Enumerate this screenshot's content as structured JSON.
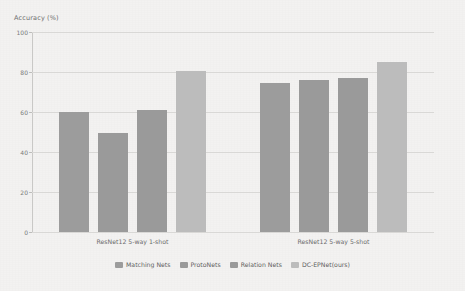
{
  "chart_data": {
    "type": "bar",
    "title": "",
    "xlabel": "",
    "ylabel": "Accuracy (%)",
    "ylim": [
      0,
      100
    ],
    "yticks": [
      0,
      20,
      40,
      60,
      80,
      100
    ],
    "ytick_labels": [
      "0",
      "20",
      "40",
      "60",
      "80",
      "100"
    ],
    "grid": true,
    "legend_position": "bottom",
    "categories": [
      "ResNet12 5-way 1-shot",
      "ResNet12 5-way 5-shot"
    ],
    "series": [
      {
        "name": "Matching Nets",
        "color": "#9c9c9c",
        "values": [
          60.0,
          74.5
        ]
      },
      {
        "name": "ProtoNets",
        "color": "#9a9a9a",
        "values": [
          49.5,
          75.8
        ]
      },
      {
        "name": "Relation Nets",
        "color": "#9a9a9a",
        "values": [
          61.0,
          77.0
        ]
      },
      {
        "name": "DC-EPNet(ours)",
        "color": "#bcbcbc",
        "values": [
          80.3,
          85.2
        ]
      }
    ]
  },
  "colors": {
    "background": "#f3f2f1",
    "gridline": "#d9d8d6",
    "axis": "#c9c8c6",
    "tick_text": "#7b7b7b",
    "label_text": "#6c6c6c",
    "legend_text": "#5f5f5f"
  }
}
